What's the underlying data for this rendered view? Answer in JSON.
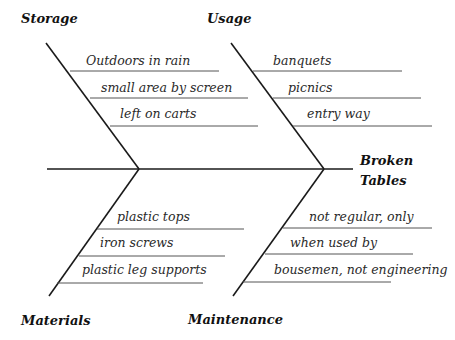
{
  "diagram": {
    "type": "fishbone",
    "effect": {
      "line1": "Broken",
      "line2": "Tables"
    },
    "categories": [
      {
        "name": "Storage",
        "causes": [
          "Outdoors in rain",
          "small area by screen",
          "left on carts"
        ]
      },
      {
        "name": "Usage",
        "causes": [
          "banquets",
          "picnics",
          "entry way"
        ]
      },
      {
        "name": "Materials",
        "causes": [
          "plastic tops",
          "iron screws",
          "plastic leg supports"
        ]
      },
      {
        "name": "Maintenance",
        "causes": [
          "not regular, only",
          "when used by",
          "bousemen, not engineering"
        ]
      }
    ]
  },
  "colors": {
    "line": "#1a1a1a",
    "sub_line": "#555555",
    "text": "#2a2a2a"
  }
}
